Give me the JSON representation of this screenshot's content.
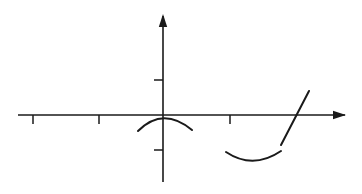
{
  "figure": {
    "kind": "cartesian-axes-sketch",
    "width": 362,
    "height": 194,
    "background_color": "#ffffff",
    "ink_color": "#1a1a1a"
  },
  "axes": {
    "x_axis": {
      "label": "x-axis",
      "y": 115,
      "x_start": 18,
      "x_end": 345,
      "stroke_width": 1.6,
      "arrow": {
        "name": "x-axis-arrowhead",
        "direction": "right",
        "tip_x": 346,
        "tip_y": 115,
        "length": 13,
        "half_width": 4.2
      },
      "ticks": [
        {
          "name": "x-tick-1",
          "x": 33,
          "above": 0,
          "below": 9
        },
        {
          "name": "x-tick-2",
          "x": 99,
          "above": 0,
          "below": 9
        },
        {
          "name": "x-tick-3",
          "x": 230,
          "above": 0,
          "below": 9
        }
      ]
    },
    "y_axis": {
      "label": "y-axis",
      "x": 163,
      "y_start": 182,
      "y_end": 16,
      "stroke_width": 1.6,
      "arrow": {
        "name": "y-axis-arrowhead",
        "direction": "up",
        "tip_x": 163,
        "tip_y": 14,
        "length": 13,
        "half_width": 4.2
      },
      "ticks": [
        {
          "name": "y-tick-positive",
          "y": 80,
          "left": 9,
          "right": 0
        },
        {
          "name": "y-tick-negative",
          "y": 150,
          "left": 9,
          "right": 0
        }
      ]
    },
    "origin": {
      "x": 163,
      "y": 115
    }
  },
  "curves": [
    {
      "name": "concave-down-arc-at-origin",
      "description": "downward-opening arc with vertex at the origin",
      "shape": "quadratic",
      "stroke_width": 2.0,
      "path": "M 138 131 Q 163 106 192 130"
    },
    {
      "name": "concave-up-arc-below-axis",
      "description": "upward-opening smile arc sitting below the x-axis",
      "shape": "quadratic",
      "stroke_width": 2.0,
      "path": "M 226 152 Q 253 170 281 151"
    }
  ],
  "segments": [
    {
      "name": "diagonal-line-segment",
      "description": "straight slanted segment crossing the x-axis from lower-left to upper-right",
      "stroke_width": 2.0,
      "x1": 281,
      "y1": 145,
      "x2": 309,
      "y2": 91
    }
  ]
}
